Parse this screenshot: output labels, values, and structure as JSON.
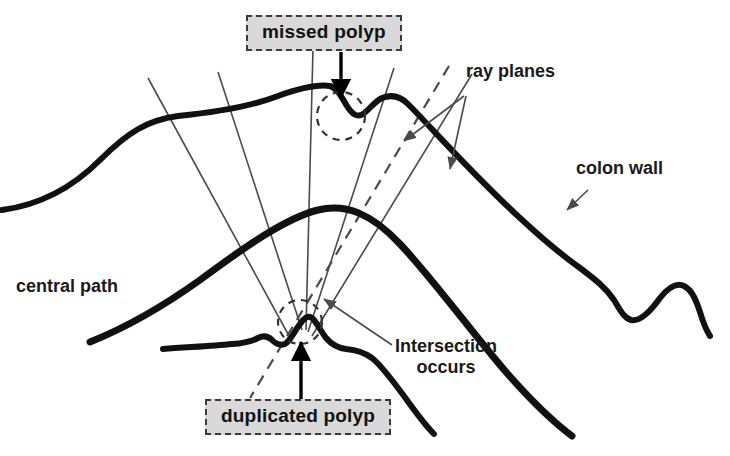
{
  "figure": {
    "background_color": "#ffffff",
    "ink_color": "#111111",
    "ray_color": "#4a4a4a",
    "label_fill_color": "#d9d9d9",
    "label_border_color": "#3a3a3a"
  },
  "labels": {
    "missed_polyp": "missed polyp",
    "duplicated_polyp": "duplicated polyp",
    "ray_planes": "ray planes",
    "colon_wall": "colon wall",
    "central_path": "central path",
    "intersection_line1": "Intersection",
    "intersection_line2": "occurs"
  },
  "annotations": {
    "missed_polyp_arrow": "down-arrow-into-wall-notch",
    "duplicated_polyp_arrow": "up-arrow-into-wall-bump",
    "missed_polyp_marker": "dashed-circle",
    "duplicated_polyp_marker": "dashed-circle",
    "colon_wall_leader": "leader-arrow",
    "ray_planes_leader_count": 2,
    "intersection_leader": "leader-arrow"
  },
  "geometry": {
    "upper_wall_path": "M 2 210 C 40 205 72 188 100 160 C 128 132 148 120 178 116 C 218 112 252 106 278 96 C 300 88 316 84 330 86 C 337 88 341 96 347 106 C 352 114 357 118 363 114 C 369 110 374 102 382 98 C 392 94 400 96 408 104 C 430 126 470 172 520 218 C 548 244 566 258 580 268 C 596 280 606 288 614 300 C 620 310 624 318 631 320 C 640 322 650 312 660 298 C 668 288 676 282 684 286 C 692 290 696 300 700 312 C 703 322 706 330 710 336",
    "lower_wall_path": "M 163 349 C 190 347 212 346 232 344 C 246 343 252 341 258 338 C 264 335 268 336 272 340 C 276 344 280 346 285 344 C 290 341 294 332 300 324 C 304 318 308 315 312 318 C 316 321 320 330 326 338 C 332 345 338 348 346 349 C 356 350 364 352 372 358 C 382 366 392 380 404 396 C 414 410 424 424 434 434",
    "central_path": "M 90 342 C 120 330 158 310 200 280 C 246 246 286 218 318 210 C 346 203 372 214 400 244 C 432 278 470 330 506 372 C 534 404 556 424 572 436",
    "rays": [
      "M 148 78 L 288 334",
      "M 218 72 L 302 330",
      "M 313 48 L 306 330",
      "M 394 68 L 308 332",
      "M 472 74 L 312 336"
    ],
    "ray_dashed": "M 449 66 L 250 398",
    "missed_polyp_circle": {
      "cx": 341,
      "cy": 116,
      "r": 24
    },
    "duplicated_polyp_circle": {
      "cx": 300,
      "cy": 322,
      "r": 22
    }
  }
}
